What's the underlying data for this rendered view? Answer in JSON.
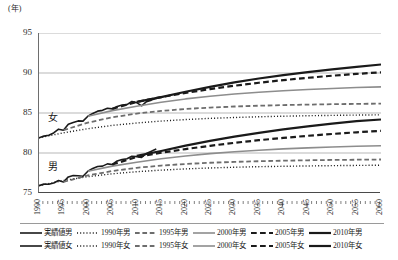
{
  "chart_data": {
    "type": "line",
    "title": "",
    "subtitle": "",
    "xlabel": "",
    "ylabel": "(年)",
    "unit_caption": "(年)",
    "xlim": [
      1990,
      2060
    ],
    "ylim": [
      75,
      95
    ],
    "ytick_labels": [
      "95",
      "90",
      "85",
      "80",
      "75"
    ],
    "ytick_values": [
      95,
      90,
      85,
      80,
      75
    ],
    "xtick_labels": [
      "1990",
      "1995",
      "2000",
      "2005",
      "2010",
      "2015",
      "2020",
      "2025",
      "2030",
      "2035",
      "2040",
      "2045",
      "2050",
      "2055",
      "2060"
    ],
    "xtick_values": [
      1990,
      1995,
      2000,
      2005,
      2010,
      2015,
      2020,
      2025,
      2030,
      2035,
      2040,
      2045,
      2050,
      2055,
      2060
    ],
    "grid": "horizontal",
    "legend_position": "bottom",
    "annotations": [
      {
        "text": "女",
        "x": 1992,
        "y": 84.4
      },
      {
        "text": "男",
        "x": 1992,
        "y": 78.3
      }
    ],
    "series": [
      {
        "name": "実績値女",
        "group": "female",
        "style": "solid",
        "color": "#1a1a1a",
        "width": 1.6,
        "x": [
          1990,
          1991,
          1992,
          1993,
          1994,
          1995,
          1996,
          1997,
          1998,
          1999,
          2000,
          2001,
          2002,
          2003,
          2004,
          2005,
          2006,
          2007,
          2008,
          2009,
          2010,
          2011,
          2012,
          2013,
          2014
        ],
        "values": [
          81.9,
          82.11,
          82.22,
          82.51,
          82.98,
          82.85,
          83.59,
          83.82,
          84.01,
          83.99,
          84.6,
          84.93,
          85.23,
          85.33,
          85.59,
          85.52,
          85.81,
          85.99,
          86.05,
          86.44,
          86.3,
          85.9,
          86.41,
          86.61,
          86.83
        ]
      },
      {
        "name": "実績値男",
        "group": "male",
        "style": "solid",
        "color": "#1a1a1a",
        "width": 1.6,
        "x": [
          1990,
          1991,
          1992,
          1993,
          1994,
          1995,
          1996,
          1997,
          1998,
          1999,
          2000,
          2001,
          2002,
          2003,
          2004,
          2005,
          2006,
          2007,
          2008,
          2009,
          2010,
          2011,
          2012,
          2013,
          2014
        ],
        "values": [
          75.92,
          76.11,
          76.09,
          76.25,
          76.57,
          76.38,
          77.01,
          77.19,
          77.16,
          77.1,
          77.72,
          78.07,
          78.32,
          78.36,
          78.64,
          78.56,
          79.0,
          79.19,
          79.29,
          79.59,
          79.55,
          79.44,
          79.94,
          80.21,
          80.5
        ]
      },
      {
        "name": "1990年女",
        "group": "female",
        "style": "dotted",
        "color": "#1a1a1a",
        "width": 1.4,
        "x": [
          1990,
          1995,
          2000,
          2005,
          2010,
          2015,
          2020,
          2025,
          2030,
          2035,
          2040,
          2045,
          2050,
          2055,
          2060
        ],
        "values": [
          81.9,
          82.52,
          83.04,
          83.45,
          83.75,
          83.99,
          84.18,
          84.33,
          84.44,
          84.53,
          84.6,
          84.66,
          84.7,
          84.74,
          84.77
        ]
      },
      {
        "name": "1990年男",
        "group": "male",
        "style": "dotted",
        "color": "#1a1a1a",
        "width": 1.4,
        "x": [
          1990,
          1995,
          2000,
          2005,
          2010,
          2015,
          2020,
          2025,
          2030,
          2035,
          2040,
          2045,
          2050,
          2055,
          2060
        ],
        "values": [
          75.92,
          76.55,
          77.04,
          77.4,
          77.66,
          77.86,
          78.01,
          78.13,
          78.22,
          78.29,
          78.34,
          78.38,
          78.42,
          78.45,
          78.47
        ]
      },
      {
        "name": "1995年女",
        "group": "female",
        "style": "dashed",
        "color": "#6d6d6d",
        "width": 1.8,
        "x": [
          1995,
          2000,
          2005,
          2010,
          2015,
          2020,
          2025,
          2030,
          2035,
          2040,
          2045,
          2050,
          2055,
          2060
        ],
        "values": [
          82.85,
          83.8,
          84.46,
          84.93,
          85.26,
          85.5,
          85.68,
          85.81,
          85.91,
          85.99,
          86.05,
          86.1,
          86.14,
          86.17
        ]
      },
      {
        "name": "1995年男",
        "group": "male",
        "style": "dashed",
        "color": "#6d6d6d",
        "width": 1.8,
        "x": [
          1995,
          2000,
          2005,
          2010,
          2015,
          2020,
          2025,
          2030,
          2035,
          2040,
          2045,
          2050,
          2055,
          2060
        ],
        "values": [
          76.38,
          77.2,
          77.75,
          78.15,
          78.43,
          78.63,
          78.78,
          78.89,
          78.97,
          79.04,
          79.09,
          79.13,
          79.16,
          79.19
        ]
      },
      {
        "name": "2000年女",
        "group": "female",
        "style": "solid",
        "color": "#8d8d8d",
        "width": 1.6,
        "x": [
          2000,
          2005,
          2010,
          2015,
          2020,
          2025,
          2030,
          2035,
          2040,
          2045,
          2050,
          2055,
          2060
        ],
        "values": [
          84.6,
          85.3,
          85.85,
          86.35,
          86.76,
          87.1,
          87.38,
          87.6,
          87.79,
          87.94,
          88.07,
          88.18,
          88.27
        ]
      },
      {
        "name": "2000年男",
        "group": "male",
        "style": "solid",
        "color": "#8d8d8d",
        "width": 1.6,
        "x": [
          2000,
          2005,
          2010,
          2015,
          2020,
          2025,
          2030,
          2035,
          2040,
          2045,
          2050,
          2055,
          2060
        ],
        "values": [
          77.72,
          78.36,
          78.85,
          79.28,
          79.63,
          79.92,
          80.16,
          80.35,
          80.51,
          80.64,
          80.75,
          80.84,
          80.91
        ]
      },
      {
        "name": "2005年女",
        "group": "female",
        "style": "dashed",
        "color": "#1a1a1a",
        "width": 2.2,
        "x": [
          2005,
          2010,
          2015,
          2020,
          2025,
          2030,
          2035,
          2040,
          2045,
          2050,
          2055,
          2060
        ],
        "values": [
          85.52,
          86.39,
          86.98,
          87.51,
          87.99,
          88.41,
          88.78,
          89.11,
          89.4,
          89.66,
          89.89,
          90.09
        ]
      },
      {
        "name": "2005年男",
        "group": "male",
        "style": "dashed",
        "color": "#1a1a1a",
        "width": 2.2,
        "x": [
          2005,
          2010,
          2015,
          2020,
          2025,
          2030,
          2035,
          2040,
          2045,
          2050,
          2055,
          2060
        ],
        "values": [
          78.56,
          79.51,
          80.03,
          80.49,
          80.9,
          81.27,
          81.6,
          81.89,
          82.15,
          82.38,
          82.59,
          82.77
        ]
      },
      {
        "name": "2010年女",
        "group": "female",
        "style": "solid",
        "color": "#1a1a1a",
        "width": 2.2,
        "x": [
          2010,
          2015,
          2020,
          2025,
          2030,
          2035,
          2040,
          2045,
          2050,
          2055,
          2060
        ],
        "values": [
          86.39,
          86.98,
          87.65,
          88.26,
          88.82,
          89.31,
          89.74,
          90.12,
          90.46,
          90.77,
          91.06
        ]
      },
      {
        "name": "2010年男",
        "group": "male",
        "style": "solid",
        "color": "#1a1a1a",
        "width": 2.2,
        "x": [
          2010,
          2015,
          2020,
          2025,
          2030,
          2035,
          2040,
          2045,
          2050,
          2055,
          2060
        ],
        "values": [
          79.64,
          80.25,
          80.93,
          81.52,
          82.05,
          82.52,
          82.95,
          83.33,
          83.67,
          83.98,
          84.19
        ]
      }
    ],
    "legend": {
      "rows": [
        [
          {
            "label": "実績値男",
            "style": "solid",
            "color": "#1a1a1a",
            "width": 1.6
          },
          {
            "label": "1990年男",
            "style": "dotted",
            "color": "#1a1a1a",
            "width": 1.4
          },
          {
            "label": "1995年男",
            "style": "dashed",
            "color": "#6d6d6d",
            "width": 1.8
          },
          {
            "label": "2000年男",
            "style": "solid",
            "color": "#8d8d8d",
            "width": 1.6
          },
          {
            "label": "2005年男",
            "style": "dashed",
            "color": "#1a1a1a",
            "width": 2.2
          },
          {
            "label": "2010年男",
            "style": "solid",
            "color": "#1a1a1a",
            "width": 2.2
          }
        ],
        [
          {
            "label": "実績値女",
            "style": "solid",
            "color": "#1a1a1a",
            "width": 1.6
          },
          {
            "label": "1990年女",
            "style": "dotted",
            "color": "#1a1a1a",
            "width": 1.4
          },
          {
            "label": "1995年女",
            "style": "dashed",
            "color": "#6d6d6d",
            "width": 1.8
          },
          {
            "label": "2000年女",
            "style": "solid",
            "color": "#8d8d8d",
            "width": 1.6
          },
          {
            "label": "2005年女",
            "style": "dashed",
            "color": "#1a1a1a",
            "width": 2.2
          },
          {
            "label": "2010年女",
            "style": "solid",
            "color": "#1a1a1a",
            "width": 2.2
          }
        ]
      ]
    }
  }
}
